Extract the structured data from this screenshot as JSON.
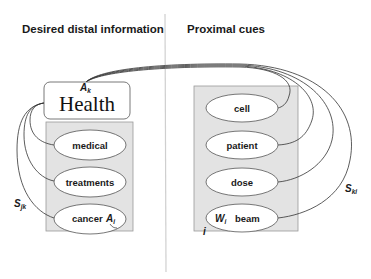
{
  "headers": {
    "left": "Desired distal information",
    "right": "Proximal cues"
  },
  "distal": {
    "top_node": {
      "label": "Health",
      "symbol": "A",
      "symbol_sub": "k"
    },
    "plate_label": "D",
    "plate_index": "i",
    "nodes": [
      {
        "label": "medical"
      },
      {
        "label": "treatments"
      },
      {
        "label": "cancer",
        "symbol": "A",
        "symbol_sub": "i"
      }
    ],
    "edge_label": {
      "main": "S",
      "sub": "jk"
    }
  },
  "proximal": {
    "plate_label": "P",
    "plate_index": "i",
    "nodes": [
      {
        "label": "cell"
      },
      {
        "label": "patient"
      },
      {
        "label": "dose"
      },
      {
        "label": "beam",
        "symbol": "W",
        "symbol_sub": "i"
      }
    ],
    "edge_label": {
      "main": "S",
      "sub": "ki"
    }
  },
  "colors": {
    "plate_fill": "#e3e3e3",
    "plate_stroke": "#9a9a9a",
    "edge": "#333333",
    "divider": "#cfcfcf"
  }
}
